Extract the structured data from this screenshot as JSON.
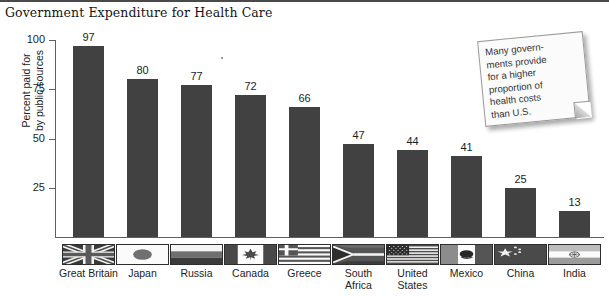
{
  "chart_data": {
    "type": "bar",
    "title": "Government Expenditure for Health Care",
    "xlabel": "",
    "ylabel": "Percent paid for\nby public sources",
    "ylim": [
      0,
      100
    ],
    "yticks": [
      100,
      75,
      50,
      25
    ],
    "grid": false,
    "legend": "none",
    "categories": [
      "Great Britain",
      "Japan",
      "Russia",
      "Canada",
      "Greece",
      "South Africa",
      "United States",
      "Mexico",
      "China",
      "India"
    ],
    "category_labels": [
      [
        "Great Britain"
      ],
      [
        "Japan"
      ],
      [
        "Russia"
      ],
      [
        "Canada"
      ],
      [
        "Greece"
      ],
      [
        "South",
        "Africa"
      ],
      [
        "United",
        "States"
      ],
      [
        "Mexico"
      ],
      [
        "China"
      ],
      [
        "India"
      ]
    ],
    "values": [
      97,
      80,
      77,
      72,
      66,
      47,
      44,
      41,
      25,
      13
    ],
    "value_labels": [
      "97",
      "80",
      "77",
      "72",
      "66",
      "47",
      "44",
      "41",
      "25",
      "13"
    ],
    "bar_color": "#414141",
    "axis_color": "#606060"
  },
  "annotation": {
    "note_text": "Many govern-\nments provide\nfor a higher\nproportion of\nhealth costs\nthan U.S.",
    "note_lines": [
      "Many govern-",
      "ments provide",
      "for a higher",
      "proportion of",
      "health costs",
      "than U.S."
    ]
  },
  "flags": {
    "icon_names": [
      "flag-great-britain-icon",
      "flag-japan-icon",
      "flag-russia-icon",
      "flag-canada-icon",
      "flag-greece-icon",
      "flag-south-africa-icon",
      "flag-united-states-icon",
      "flag-mexico-icon",
      "flag-china-icon",
      "flag-india-icon"
    ]
  }
}
